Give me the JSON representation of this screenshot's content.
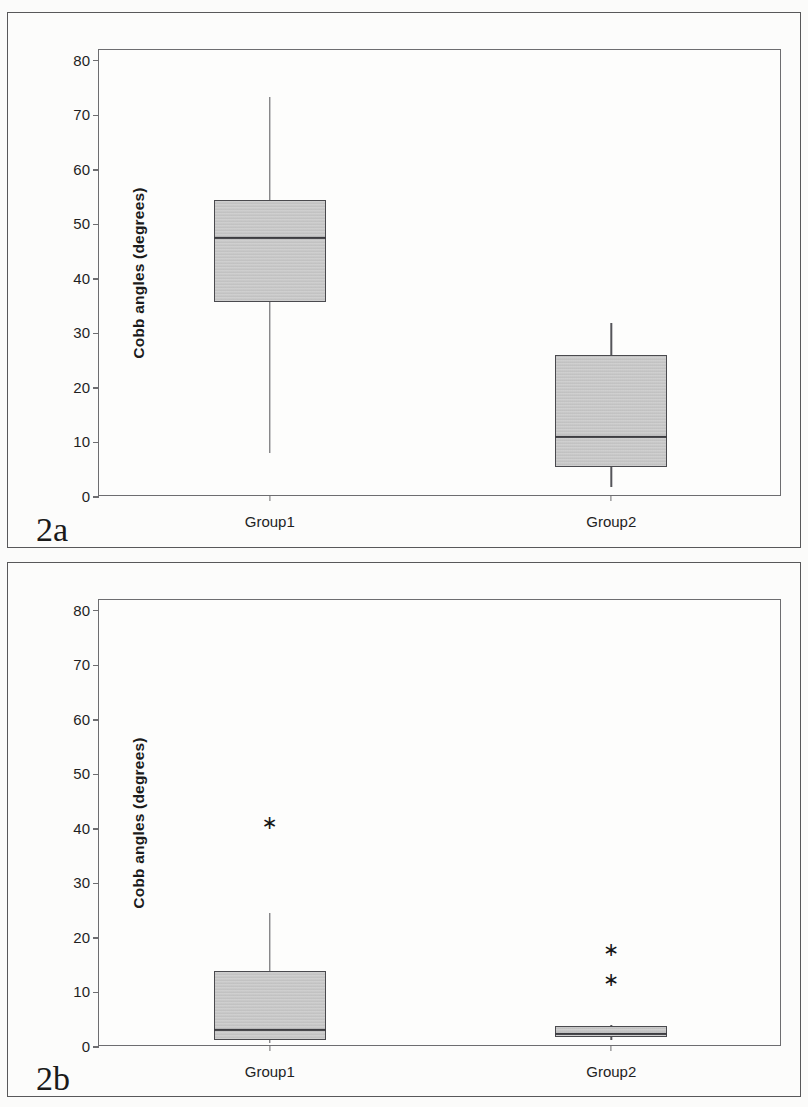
{
  "figure": {
    "panels": [
      {
        "caption": "2a",
        "axis": {
          "ylabel": "Cobb angles (degrees)",
          "yticks": [
            "0",
            "10",
            "20",
            "30",
            "40",
            "50",
            "60",
            "70",
            "80"
          ],
          "ymin": 0,
          "ymax": 82,
          "xticks": [
            "Group1",
            "Group2"
          ]
        }
      },
      {
        "caption": "2b",
        "axis": {
          "ylabel": "Cobb angles (degrees)",
          "yticks": [
            "0",
            "10",
            "20",
            "30",
            "40",
            "50",
            "60",
            "70",
            "80"
          ],
          "ymin": 0,
          "ymax": 82,
          "xticks": [
            "Group1",
            "Group2"
          ]
        }
      }
    ]
  },
  "chart_data": [
    {
      "type": "box",
      "title": "2a",
      "xlabel": "",
      "ylabel": "Cobb angles (degrees)",
      "ylim": [
        0,
        82
      ],
      "yticks": [
        0,
        10,
        20,
        30,
        40,
        50,
        60,
        70,
        80
      ],
      "grid": false,
      "legend": "none",
      "categories": [
        "Group1",
        "Group2"
      ],
      "boxes": [
        {
          "category": "Group1",
          "whisker_low": 8.0,
          "q1": 35.8,
          "median": 47.6,
          "q3": 54.5,
          "whisker_high": 73.4,
          "outliers": []
        },
        {
          "category": "Group2",
          "whisker_low": 1.9,
          "q1": 5.5,
          "median": 11.0,
          "q3": 26.0,
          "whisker_high": 31.9,
          "outliers": []
        }
      ]
    },
    {
      "type": "box",
      "title": "2b",
      "xlabel": "",
      "ylabel": "Cobb angles (degrees)",
      "ylim": [
        0,
        82
      ],
      "yticks": [
        0,
        10,
        20,
        30,
        40,
        50,
        60,
        70,
        80
      ],
      "grid": false,
      "legend": "none",
      "categories": [
        "Group1",
        "Group2"
      ],
      "boxes": [
        {
          "category": "Group1",
          "whisker_low": 0.8,
          "q1": 1.3,
          "median": 3.1,
          "q3": 13.9,
          "whisker_high": 24.6,
          "outliers": [
            41.2
          ]
        },
        {
          "category": "Group2",
          "whisker_low": 1.2,
          "q1": 1.9,
          "median": 2.4,
          "q3": 3.8,
          "whisker_high": 4.0,
          "outliers": [
            18.0,
            12.4
          ]
        }
      ]
    }
  ]
}
